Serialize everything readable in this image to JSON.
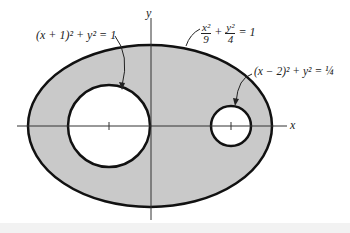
{
  "diagram": {
    "axes": {
      "x_label": "x",
      "y_label": "y"
    },
    "labels": {
      "big_circle": "(x + 1)² + y² = 1",
      "ellipse_num_x": "x²",
      "ellipse_den_x": "9",
      "plus": "+",
      "ellipse_num_y": "y²",
      "ellipse_den_y": "4",
      "ellipse_eq": "= 1",
      "small_circle": "(x − 2)² + y² = ¼"
    },
    "shapes": {
      "ellipse": {
        "cx": 150,
        "cy": 126,
        "rx": 122,
        "ry": 81,
        "fill": "#c8c8c8"
      },
      "big_circle": {
        "cx": 109,
        "cy": 126,
        "r": 41
      },
      "small_circle": {
        "cx": 231,
        "cy": 126,
        "r": 20
      }
    }
  }
}
